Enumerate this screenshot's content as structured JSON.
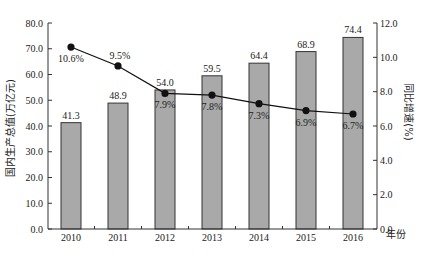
{
  "chart_data": {
    "type": "bar+line",
    "title": "",
    "categories": [
      "2010",
      "2011",
      "2012",
      "2013",
      "2014",
      "2015",
      "2016"
    ],
    "xlabel": "年份",
    "series": [
      {
        "name": "国内生产总值",
        "type": "bar",
        "axis": "left",
        "values": [
          41.3,
          48.9,
          54.0,
          59.5,
          64.4,
          68.9,
          74.4
        ],
        "labels": [
          "41.3",
          "48.9",
          "54.0",
          "59.5",
          "64.4",
          "68.9",
          "74.4"
        ],
        "color": "#a9a9a9"
      },
      {
        "name": "同比增速",
        "type": "line",
        "axis": "right",
        "values": [
          10.6,
          9.5,
          7.9,
          7.8,
          7.3,
          6.9,
          6.7
        ],
        "labels": [
          "10.6%",
          "9.5%",
          "7.9%",
          "7.8%",
          "7.3%",
          "6.9%",
          "6.7%"
        ],
        "color": "#111111"
      }
    ],
    "ylabel_left": "国内生产总值(万亿元)",
    "ylabel_right": "同比增速(%)",
    "ylim_left": [
      0,
      80
    ],
    "ylim_right": [
      0,
      12
    ],
    "yticks_left": [
      "0.0",
      "10.0",
      "20.0",
      "30.0",
      "40.0",
      "50.0",
      "60.0",
      "70.0",
      "80.0"
    ],
    "yticks_right": [
      "0.0",
      "2.0",
      "4.0",
      "6.0",
      "8.0",
      "10.0",
      "12.0"
    ],
    "grid": false,
    "legend": "none"
  }
}
